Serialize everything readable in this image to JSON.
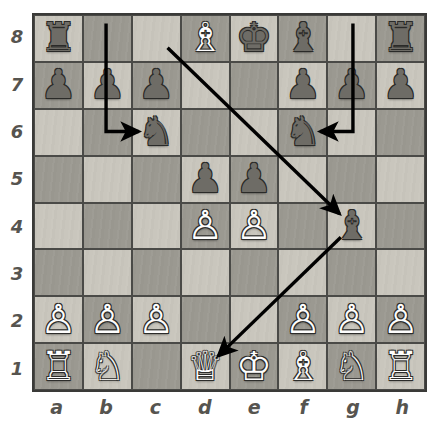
{
  "board": {
    "files": [
      "a",
      "b",
      "c",
      "d",
      "e",
      "f",
      "g",
      "h"
    ],
    "ranks": [
      "8",
      "7",
      "6",
      "5",
      "4",
      "3",
      "2",
      "1"
    ],
    "light_square_color": "#c9c6bd",
    "dark_square_color": "#9b9991",
    "border_color": "#3a3a38",
    "arrow_color": "#000000",
    "white_piece_color": "#fdfdfd",
    "black_piece_color": "#6e6c66",
    "position_rows": [
      [
        {
          "square": "a8",
          "piece": "rook",
          "color": "black",
          "glyph": "♜"
        },
        {
          "square": "b8",
          "piece": "",
          "color": "",
          "glyph": ""
        },
        {
          "square": "c8",
          "piece": "",
          "color": "",
          "glyph": ""
        },
        {
          "square": "d8",
          "piece": "bishop",
          "color": "white",
          "glyph": "♗"
        },
        {
          "square": "e8",
          "piece": "king",
          "color": "black",
          "glyph": "♚"
        },
        {
          "square": "f8",
          "piece": "bishop",
          "color": "black",
          "glyph": "♝"
        },
        {
          "square": "g8",
          "piece": "",
          "color": "",
          "glyph": ""
        },
        {
          "square": "h8",
          "piece": "rook",
          "color": "black",
          "glyph": "♜"
        }
      ],
      [
        {
          "square": "a7",
          "piece": "pawn",
          "color": "black",
          "glyph": "♟"
        },
        {
          "square": "b7",
          "piece": "pawn",
          "color": "black",
          "glyph": "♟"
        },
        {
          "square": "c7",
          "piece": "pawn",
          "color": "black",
          "glyph": "♟"
        },
        {
          "square": "d7",
          "piece": "",
          "color": "",
          "glyph": ""
        },
        {
          "square": "e7",
          "piece": "",
          "color": "",
          "glyph": ""
        },
        {
          "square": "f7",
          "piece": "pawn",
          "color": "black",
          "glyph": "♟"
        },
        {
          "square": "g7",
          "piece": "pawn",
          "color": "black",
          "glyph": "♟"
        },
        {
          "square": "h7",
          "piece": "pawn",
          "color": "black",
          "glyph": "♟"
        }
      ],
      [
        {
          "square": "a6",
          "piece": "",
          "color": "",
          "glyph": ""
        },
        {
          "square": "b6",
          "piece": "",
          "color": "",
          "glyph": ""
        },
        {
          "square": "c6",
          "piece": "knight",
          "color": "black",
          "glyph": "♞"
        },
        {
          "square": "d6",
          "piece": "",
          "color": "",
          "glyph": ""
        },
        {
          "square": "e6",
          "piece": "",
          "color": "",
          "glyph": ""
        },
        {
          "square": "f6",
          "piece": "knight",
          "color": "black",
          "glyph": "♞"
        },
        {
          "square": "g6",
          "piece": "",
          "color": "",
          "glyph": ""
        },
        {
          "square": "h6",
          "piece": "",
          "color": "",
          "glyph": ""
        }
      ],
      [
        {
          "square": "a5",
          "piece": "",
          "color": "",
          "glyph": ""
        },
        {
          "square": "b5",
          "piece": "",
          "color": "",
          "glyph": ""
        },
        {
          "square": "c5",
          "piece": "",
          "color": "",
          "glyph": ""
        },
        {
          "square": "d5",
          "piece": "pawn",
          "color": "black",
          "glyph": "♟"
        },
        {
          "square": "e5",
          "piece": "pawn",
          "color": "black",
          "glyph": "♟"
        },
        {
          "square": "f5",
          "piece": "",
          "color": "",
          "glyph": ""
        },
        {
          "square": "g5",
          "piece": "",
          "color": "",
          "glyph": ""
        },
        {
          "square": "h5",
          "piece": "",
          "color": "",
          "glyph": ""
        }
      ],
      [
        {
          "square": "a4",
          "piece": "",
          "color": "",
          "glyph": ""
        },
        {
          "square": "b4",
          "piece": "",
          "color": "",
          "glyph": ""
        },
        {
          "square": "c4",
          "piece": "",
          "color": "",
          "glyph": ""
        },
        {
          "square": "d4",
          "piece": "pawn",
          "color": "white",
          "glyph": "♙"
        },
        {
          "square": "e4",
          "piece": "pawn",
          "color": "white",
          "glyph": "♙"
        },
        {
          "square": "f4",
          "piece": "",
          "color": "",
          "glyph": ""
        },
        {
          "square": "g4",
          "piece": "bishop",
          "color": "black",
          "glyph": "♝"
        },
        {
          "square": "h4",
          "piece": "",
          "color": "",
          "glyph": ""
        }
      ],
      [
        {
          "square": "a3",
          "piece": "",
          "color": "",
          "glyph": ""
        },
        {
          "square": "b3",
          "piece": "",
          "color": "",
          "glyph": ""
        },
        {
          "square": "c3",
          "piece": "",
          "color": "",
          "glyph": ""
        },
        {
          "square": "d3",
          "piece": "",
          "color": "",
          "glyph": ""
        },
        {
          "square": "e3",
          "piece": "",
          "color": "",
          "glyph": ""
        },
        {
          "square": "f3",
          "piece": "",
          "color": "",
          "glyph": ""
        },
        {
          "square": "g3",
          "piece": "",
          "color": "",
          "glyph": ""
        },
        {
          "square": "h3",
          "piece": "",
          "color": "",
          "glyph": ""
        }
      ],
      [
        {
          "square": "a2",
          "piece": "pawn",
          "color": "white",
          "glyph": "♙"
        },
        {
          "square": "b2",
          "piece": "pawn",
          "color": "white",
          "glyph": "♙"
        },
        {
          "square": "c2",
          "piece": "pawn",
          "color": "white",
          "glyph": "♙"
        },
        {
          "square": "d2",
          "piece": "",
          "color": "",
          "glyph": ""
        },
        {
          "square": "e2",
          "piece": "",
          "color": "",
          "glyph": ""
        },
        {
          "square": "f2",
          "piece": "pawn",
          "color": "white",
          "glyph": "♙"
        },
        {
          "square": "g2",
          "piece": "pawn",
          "color": "white",
          "glyph": "♙"
        },
        {
          "square": "h2",
          "piece": "pawn",
          "color": "white",
          "glyph": "♙"
        }
      ],
      [
        {
          "square": "a1",
          "piece": "rook",
          "color": "white",
          "glyph": "♖"
        },
        {
          "square": "b1",
          "piece": "knight",
          "color": "white",
          "glyph": "♘"
        },
        {
          "square": "c1",
          "piece": "",
          "color": "",
          "glyph": ""
        },
        {
          "square": "d1",
          "piece": "queen",
          "color": "white",
          "glyph": "♕"
        },
        {
          "square": "e1",
          "piece": "king",
          "color": "white",
          "glyph": "♔"
        },
        {
          "square": "f1",
          "piece": "bishop",
          "color": "white",
          "glyph": "♗"
        },
        {
          "square": "g1",
          "piece": "knight",
          "color": "white",
          "glyph": "♘"
        },
        {
          "square": "h1",
          "piece": "rook",
          "color": "white",
          "glyph": "♖"
        }
      ]
    ],
    "arrows": [
      {
        "name": "arrow-b8-c6",
        "kind": "elbow",
        "from": "b8",
        "to": "c6"
      },
      {
        "name": "arrow-g8-f6",
        "kind": "elbow",
        "from": "g8",
        "to": "f6"
      },
      {
        "name": "arrow-c8-g4",
        "kind": "diagonal",
        "from": "c8",
        "to": "g4"
      },
      {
        "name": "arrow-g4-d1",
        "kind": "diagonal",
        "from": "g4",
        "to": "d1"
      }
    ]
  }
}
